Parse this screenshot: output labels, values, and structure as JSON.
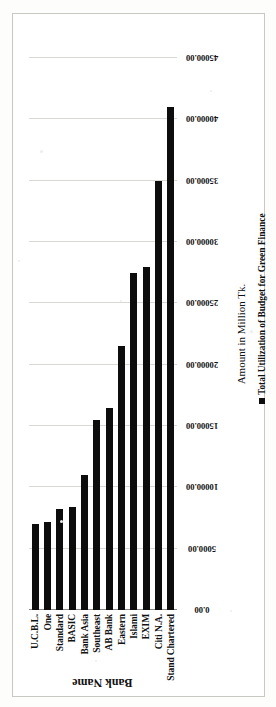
{
  "chart_data": {
    "type": "bar",
    "orientation": "vertical-rotated",
    "title": "",
    "xlabel": "Bank Name",
    "ylabel": "Amount in Million Tk.",
    "categories": [
      "U.C.B.L.",
      "One",
      "Standard",
      "BASIC",
      "Bank Asia",
      "Southeast",
      "AB Bank",
      "Eastern",
      "Islami",
      "EXIM",
      "Citi N.A.",
      "Stand Chartered"
    ],
    "values": [
      7000,
      7200,
      8200,
      8400,
      11000,
      15500,
      16500,
      21500,
      27500,
      28000,
      35000,
      41000
    ],
    "series": [
      {
        "name": "Total Utilization of Budget for Green Finance",
        "values": [
          7000,
          7200,
          8200,
          8400,
          11000,
          15500,
          16500,
          21500,
          27500,
          28000,
          35000,
          41000
        ]
      }
    ],
    "ylim": [
      0,
      45000
    ],
    "ytick_labels": [
      "0.00",
      "5000.00",
      "10000.00",
      "15000.00",
      "20000.00",
      "25000.00",
      "30000.00",
      "35000.00",
      "40000.00",
      "45000.00"
    ],
    "ytick_values": [
      0,
      5000,
      10000,
      15000,
      20000,
      25000,
      30000,
      35000,
      40000,
      45000
    ],
    "grid": true,
    "legend": {
      "position": "bottom",
      "entries": [
        {
          "label": "Total Utilization of Budget for Green Finance",
          "color": "#0d0d0d",
          "marker": "square"
        }
      ]
    },
    "colors": {
      "bar": "#0d0d0d",
      "grid": "#d8d8d4",
      "axis": "#8a8a86",
      "border": "#c9c9c4",
      "background": "#ffffff",
      "text": "#111111"
    }
  },
  "axis_titles": {
    "category": "Bank Name",
    "value": "Amount in Million Tk."
  }
}
